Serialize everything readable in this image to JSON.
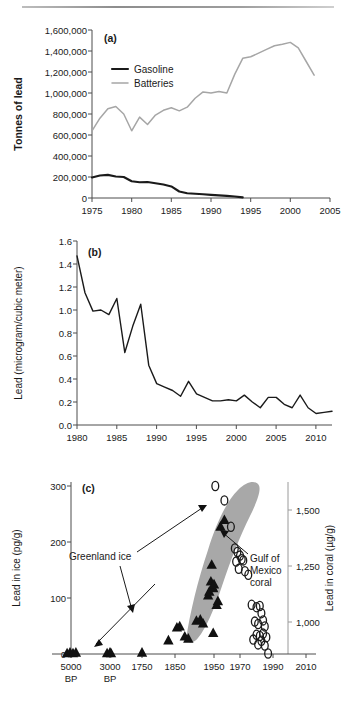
{
  "figure": {
    "panel_a_label": "(a)",
    "panel_b_label": "(b)",
    "panel_c_label": "(c)"
  },
  "chart_data": [
    {
      "type": "line",
      "panel": "(a)",
      "title": "",
      "xlabel": "",
      "ylabel": "Tonnes of lead",
      "xlim": [
        1975,
        2005
      ],
      "ylim": [
        0,
        1600000
      ],
      "xticks": [
        1975,
        1980,
        1985,
        1990,
        1995,
        2000,
        2005
      ],
      "yticks": [
        0,
        200000,
        400000,
        600000,
        800000,
        1000000,
        1200000,
        1400000,
        1600000
      ],
      "ytick_labels": [
        "0",
        "200,000",
        "400,000",
        "600,000",
        "800,000",
        "1,000,000",
        "1,200,000",
        "1,400,000",
        "1,600,000"
      ],
      "grid": false,
      "legend_position": "top-left",
      "series": [
        {
          "name": "Gasoline",
          "color": "#1a1a1a",
          "x": [
            1975,
            1976,
            1977,
            1978,
            1979,
            1980,
            1981,
            1982,
            1983,
            1984,
            1985,
            1986,
            1987,
            1988,
            1989,
            1990,
            1991,
            1992,
            1993,
            1994
          ],
          "values": [
            196000,
            215000,
            220000,
            205000,
            200000,
            160000,
            150000,
            152000,
            140000,
            128000,
            110000,
            62000,
            45000,
            40000,
            36000,
            30000,
            25000,
            20000,
            14000,
            6000
          ]
        },
        {
          "name": "Batteries",
          "color": "#a6a6a6",
          "x": [
            1975,
            1976,
            1977,
            1978,
            1979,
            1980,
            1981,
            1982,
            1983,
            1984,
            1985,
            1986,
            1987,
            1988,
            1989,
            1990,
            1991,
            1992,
            1993,
            1994,
            1995,
            1996,
            1997,
            1998,
            1999,
            2000,
            2001,
            2002,
            2003
          ],
          "values": [
            640000,
            760000,
            850000,
            872000,
            800000,
            640000,
            770000,
            700000,
            790000,
            835000,
            860000,
            830000,
            865000,
            950000,
            1010000,
            1000000,
            1015000,
            1000000,
            1180000,
            1330000,
            1345000,
            1380000,
            1415000,
            1450000,
            1465000,
            1482000,
            1430000,
            1300000,
            1170000
          ]
        }
      ]
    },
    {
      "type": "line",
      "panel": "(b)",
      "title": "",
      "xlabel": "",
      "ylabel": "Lead (microgram/cubic meter)",
      "xlim": [
        1980,
        2012
      ],
      "ylim": [
        0.0,
        1.6
      ],
      "xticks": [
        1980,
        1985,
        1990,
        1995,
        2000,
        2005,
        2010
      ],
      "yticks": [
        0.0,
        0.2,
        0.4,
        0.6,
        0.8,
        1.0,
        1.2,
        1.4,
        1.6
      ],
      "ytick_labels": [
        "0.0",
        "0.2",
        "0.4",
        "0.6",
        "0.8",
        "1.0",
        "1.2",
        "1.4",
        "1.6"
      ],
      "grid": false,
      "series": [
        {
          "name": "Airborne lead",
          "color": "#1a1a1a",
          "x": [
            1980,
            1981,
            1982,
            1983,
            1984,
            1985,
            1986,
            1987,
            1988,
            1989,
            1990,
            1991,
            1992,
            1993,
            1994,
            1995,
            1996,
            1997,
            1998,
            1999,
            2000,
            2001,
            2002,
            2003,
            2004,
            2005,
            2006,
            2007,
            2008,
            2009,
            2010,
            2011,
            2012
          ],
          "values": [
            1.47,
            1.15,
            0.99,
            1.0,
            0.96,
            1.1,
            0.63,
            0.86,
            1.05,
            0.52,
            0.36,
            0.33,
            0.3,
            0.25,
            0.38,
            0.27,
            0.24,
            0.21,
            0.21,
            0.22,
            0.21,
            0.26,
            0.2,
            0.15,
            0.24,
            0.24,
            0.18,
            0.15,
            0.26,
            0.15,
            0.1,
            0.11,
            0.12
          ]
        }
      ]
    },
    {
      "type": "scatter",
      "panel": "(c)",
      "title": "",
      "xlabel": "",
      "ylabel": "Lead in ice (pg/g)",
      "ylabel_right": "Lead in coral (µg/g)",
      "ylim": [
        0,
        300
      ],
      "yticks": [
        0,
        100,
        200,
        300
      ],
      "ytick_labels": [
        "0",
        "100",
        "200",
        "300"
      ],
      "ylim_right": [
        860,
        1560
      ],
      "yticks_right": [
        1000,
        1250,
        1500
      ],
      "ytick_labels_right": [
        "1,000",
        "1,250",
        "1,500"
      ],
      "xticks": [
        -5000,
        -3000,
        1750,
        1850,
        1950,
        1970,
        1990,
        2010
      ],
      "xtick_labels": [
        "5000\nBP",
        "3000\nBP",
        "1750",
        "1850",
        "1950",
        "1970",
        "1990",
        "2010"
      ],
      "grid": false,
      "annotations": [
        {
          "text": "Greenland ice",
          "target": "triangles"
        },
        {
          "text": "Gulf of\nMexico\ncoral",
          "target": "gray-band"
        }
      ],
      "series": [
        {
          "name": "Greenland ice",
          "marker": "triangle",
          "color": "#111111",
          "axis": "left",
          "points": [
            {
              "x": -5200,
              "y": 2
            },
            {
              "x": -5050,
              "y": 3
            },
            {
              "x": -4900,
              "y": 2
            },
            {
              "x": -4750,
              "y": 3
            },
            {
              "x": -3150,
              "y": 2
            },
            {
              "x": -3000,
              "y": 3
            },
            {
              "x": -2850,
              "y": 2
            },
            {
              "x": 1750,
              "y": 3
            },
            {
              "x": 1830,
              "y": 25
            },
            {
              "x": 1855,
              "y": 48
            },
            {
              "x": 1862,
              "y": 50
            },
            {
              "x": 1875,
              "y": 32
            },
            {
              "x": 1884,
              "y": 28
            },
            {
              "x": 1905,
              "y": 60
            },
            {
              "x": 1915,
              "y": 62
            },
            {
              "x": 1922,
              "y": 55
            },
            {
              "x": 1935,
              "y": 105
            },
            {
              "x": 1938,
              "y": 112
            },
            {
              "x": 1942,
              "y": 130
            },
            {
              "x": 1944,
              "y": 160
            },
            {
              "x": 1946,
              "y": 120
            },
            {
              "x": 1948,
              "y": 118
            },
            {
              "x": 1950,
              "y": 125
            },
            {
              "x": 1952,
              "y": 88
            },
            {
              "x": 1953,
              "y": 95
            },
            {
              "x": 1955,
              "y": 228
            },
            {
              "x": 1958,
              "y": 240
            },
            {
              "x": 1948,
              "y": 38
            }
          ]
        },
        {
          "name": "Gulf of Mexico coral",
          "marker": "circle",
          "color": "#1a1a1a",
          "axis": "right",
          "points": [
            {
              "x": 1951,
              "y": 1560
            },
            {
              "x": 1958,
              "y": 1500
            },
            {
              "x": 1963,
              "y": 1390
            },
            {
              "x": 1966,
              "y": 1300
            },
            {
              "x": 1968,
              "y": 1285
            },
            {
              "x": 1970,
              "y": 1270
            },
            {
              "x": 1971,
              "y": 1255
            },
            {
              "x": 1972,
              "y": 1250
            },
            {
              "x": 1967,
              "y": 1245
            },
            {
              "x": 1969,
              "y": 1215
            },
            {
              "x": 1973,
              "y": 1205
            },
            {
              "x": 1975,
              "y": 1190
            },
            {
              "x": 1977,
              "y": 1065
            },
            {
              "x": 1980,
              "y": 1055
            },
            {
              "x": 1982,
              "y": 1060
            },
            {
              "x": 1983,
              "y": 1030
            },
            {
              "x": 1979,
              "y": 995
            },
            {
              "x": 1981,
              "y": 985
            },
            {
              "x": 1984,
              "y": 1000
            },
            {
              "x": 1985,
              "y": 975
            },
            {
              "x": 1980,
              "y": 940
            },
            {
              "x": 1982,
              "y": 935
            },
            {
              "x": 1984,
              "y": 945
            },
            {
              "x": 1978,
              "y": 920
            },
            {
              "x": 1983,
              "y": 915
            },
            {
              "x": 1986,
              "y": 930
            },
            {
              "x": 1981,
              "y": 900
            },
            {
              "x": 1985,
              "y": 895
            },
            {
              "x": 1987,
              "y": 862
            }
          ]
        }
      ]
    }
  ]
}
